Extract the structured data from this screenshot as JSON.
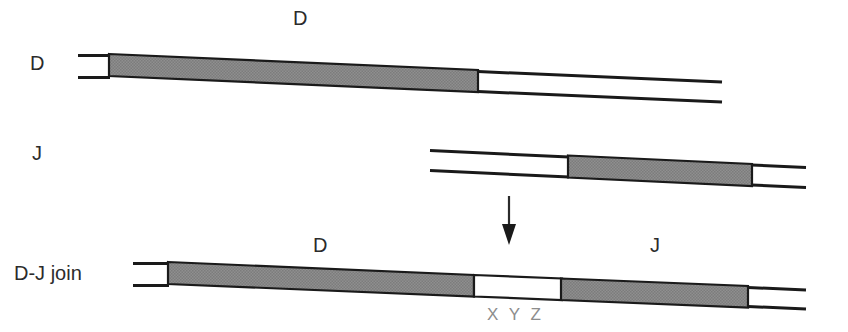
{
  "figure": {
    "title_visible": false,
    "background_color": "#ffffff",
    "shaded_block_color": "#8a8a8a",
    "line_color": "#1a1a1a",
    "text_color": "#2b2b2b",
    "junction_text_color": "#8d8d8d"
  },
  "rows": [
    {
      "id": "d-segment",
      "row_label": "D",
      "segment_label": "D",
      "duplex_y": 62,
      "duplex_height": 26,
      "label_x": 38,
      "label_y": 68,
      "segment_label_x": 300,
      "segment_label_y": 25,
      "open_left": {
        "x1": 78,
        "x2": 108
      },
      "block": {
        "x1": 108,
        "x2": 478
      },
      "open_right": {
        "x1": 478,
        "x2": 722
      },
      "tilt": 16
    },
    {
      "id": "j-segment",
      "row_label": "J",
      "segment_label": "",
      "duplex_y": 152,
      "duplex_height": 24,
      "label_x": 40,
      "label_y": 158,
      "open_left": {
        "x1": 430,
        "x2": 568
      },
      "block": {
        "x1": 568,
        "x2": 752
      },
      "open_right": {
        "x1": 752,
        "x2": 806
      },
      "tilt": 12
    },
    {
      "id": "dj-join",
      "row_label": "D-J join",
      "duplex_y": 272,
      "duplex_height": 24,
      "label_x": 38,
      "label_y": 278,
      "open_left": {
        "x1": 133,
        "x2": 168
      },
      "block_d": {
        "x1": 168,
        "x2": 474
      },
      "gap": {
        "x1": 474,
        "x2": 562
      },
      "block_j": {
        "x1": 562,
        "x2": 748
      },
      "open_right": {
        "x1": 748,
        "x2": 806
      },
      "tilt": 14,
      "labels": {
        "d": {
          "text": "D",
          "x": 320,
          "y": 252
        },
        "j": {
          "text": "J",
          "x": 655,
          "y": 252
        },
        "junction": {
          "text": "X Y Z",
          "x": 518,
          "y": 312
        }
      }
    }
  ],
  "arrow": {
    "name": "downward-arrow",
    "x": 509,
    "y_start": 196,
    "y_end": 242
  }
}
